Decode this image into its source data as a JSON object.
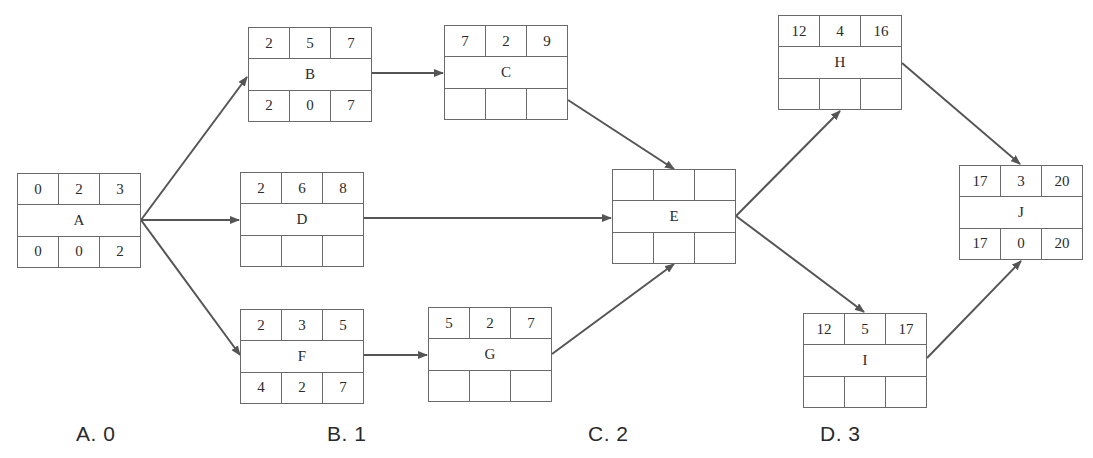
{
  "diagram": {
    "type": "activity-on-node network (precedence diagram)",
    "edge_color": "#555555",
    "nodes": {
      "A": {
        "name": "A",
        "top": [
          "0",
          "2",
          "3"
        ],
        "bottom": [
          "0",
          "0",
          "2"
        ]
      },
      "B": {
        "name": "B",
        "top": [
          "2",
          "5",
          "7"
        ],
        "bottom": [
          "2",
          "0",
          "7"
        ]
      },
      "C": {
        "name": "C",
        "top": [
          "7",
          "2",
          "9"
        ],
        "bottom": [
          "",
          "",
          ""
        ]
      },
      "D": {
        "name": "D",
        "top": [
          "2",
          "6",
          "8"
        ],
        "bottom": [
          "",
          "",
          ""
        ]
      },
      "E": {
        "name": "E",
        "top": [
          "",
          "",
          ""
        ],
        "bottom": [
          "",
          "",
          ""
        ]
      },
      "F": {
        "name": "F",
        "top": [
          "2",
          "3",
          "5"
        ],
        "bottom": [
          "4",
          "2",
          "7"
        ]
      },
      "G": {
        "name": "G",
        "top": [
          "5",
          "2",
          "7"
        ],
        "bottom": [
          "",
          "",
          ""
        ]
      },
      "H": {
        "name": "H",
        "top": [
          "12",
          "4",
          "16"
        ],
        "bottom": [
          "",
          "",
          ""
        ]
      },
      "I": {
        "name": "I",
        "top": [
          "12",
          "5",
          "17"
        ],
        "bottom": [
          "",
          "",
          ""
        ]
      },
      "J": {
        "name": "J",
        "top": [
          "17",
          "3",
          "20"
        ],
        "bottom": [
          "17",
          "0",
          "20"
        ]
      }
    },
    "edges": [
      {
        "from": "A",
        "to": "B"
      },
      {
        "from": "A",
        "to": "D"
      },
      {
        "from": "A",
        "to": "F"
      },
      {
        "from": "B",
        "to": "C"
      },
      {
        "from": "C",
        "to": "E"
      },
      {
        "from": "D",
        "to": "E"
      },
      {
        "from": "F",
        "to": "G"
      },
      {
        "from": "G",
        "to": "E"
      },
      {
        "from": "E",
        "to": "H"
      },
      {
        "from": "E",
        "to": "I"
      },
      {
        "from": "H",
        "to": "J"
      },
      {
        "from": "I",
        "to": "J"
      }
    ]
  },
  "options": [
    {
      "label": "A.  0"
    },
    {
      "label": "B.  1"
    },
    {
      "label": "C.  2"
    },
    {
      "label": "D.  3"
    }
  ]
}
